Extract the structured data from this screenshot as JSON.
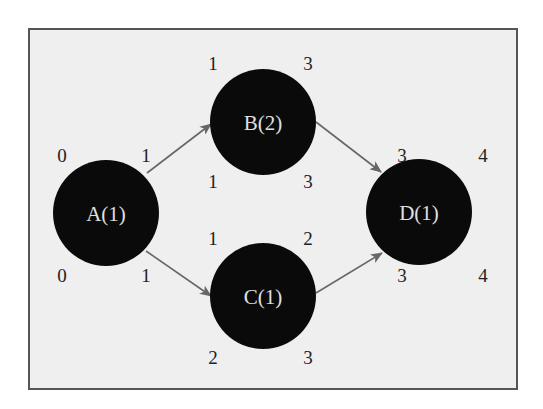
{
  "diagram": {
    "type": "activity-network",
    "colors": {
      "background": "#efefef",
      "border": "#555555",
      "node_fill": "#0a0a0a",
      "node_text": "#e0e0e0",
      "edge": "#666666",
      "number_text": "#222222"
    },
    "nodes": [
      {
        "id": "A",
        "label": "A(1)",
        "cx": 106,
        "cy": 213,
        "r": 53,
        "top_left": "0",
        "top_right": "1",
        "bottom_left": "0",
        "bottom_right": "1"
      },
      {
        "id": "B",
        "label": "B(2)",
        "cx": 263,
        "cy": 122,
        "r": 53,
        "top_left": "1",
        "top_right": "3",
        "bottom_left": "1",
        "bottom_right": "3"
      },
      {
        "id": "C",
        "label": "C(1)",
        "cx": 263,
        "cy": 296,
        "r": 53,
        "top_left": "1",
        "top_right": "2",
        "bottom_left": "2",
        "bottom_right": "3"
      },
      {
        "id": "D",
        "label": "D(1)",
        "cx": 419,
        "cy": 212,
        "r": 53,
        "top_left": "3",
        "top_right": "4",
        "bottom_left": "3",
        "bottom_right": "4"
      }
    ],
    "edges": [
      {
        "from": "A",
        "to": "B"
      },
      {
        "from": "A",
        "to": "C"
      },
      {
        "from": "B",
        "to": "D"
      },
      {
        "from": "C",
        "to": "D"
      }
    ]
  }
}
